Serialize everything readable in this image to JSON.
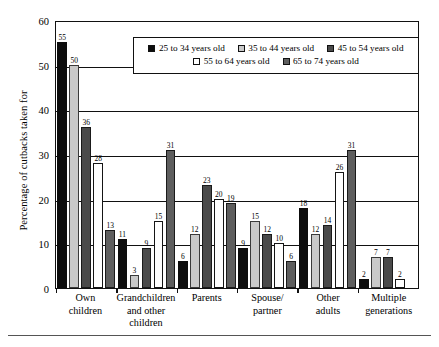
{
  "chart_data": {
    "type": "bar",
    "title": "",
    "xlabel": "",
    "ylabel": "Percentage of cutbacks taken for",
    "ylim": [
      0,
      60
    ],
    "yticks": [
      0,
      10,
      20,
      30,
      40,
      50,
      60
    ],
    "grid": true,
    "legend_position": "top-center-inside",
    "categories": [
      "Own children",
      "Grandchildren and other children",
      "Parents",
      "Spouse/ partner",
      "Other adults",
      "Multiple generations"
    ],
    "series": [
      {
        "name": "25 to 34 years old",
        "color": "#0d0d0d",
        "values": [
          55,
          11,
          6,
          9,
          18,
          2
        ]
      },
      {
        "name": "35 to 44 years old",
        "color": "#c9c9c9",
        "values": [
          50,
          3,
          12,
          15,
          12,
          7
        ]
      },
      {
        "name": "45 to 54 years old",
        "color": "#4a4a4a",
        "values": [
          36,
          9,
          23,
          12,
          14,
          7
        ]
      },
      {
        "name": "55 to 64 years old",
        "color": "#ffffff",
        "values": [
          28,
          15,
          20,
          10,
          26,
          2
        ]
      },
      {
        "name": "65 to 74 years old",
        "color": "#5e5e5e",
        "values": [
          13,
          31,
          19,
          6,
          31,
          0
        ]
      }
    ]
  },
  "axis": {
    "y_title": "Percentage of cutbacks taken for",
    "y_ticks": [
      "60",
      "50",
      "40",
      "30",
      "20",
      "10",
      "0"
    ],
    "x_categories": [
      [
        "Own",
        "children"
      ],
      [
        "Grandchildren",
        "and other",
        "children"
      ],
      [
        "Parents"
      ],
      [
        "Spouse/",
        "partner"
      ],
      [
        "Other",
        "adults"
      ],
      [
        "Multiple",
        "generations"
      ]
    ]
  },
  "legend": {
    "row1": [
      {
        "label": "25 to 34 years old",
        "color": "#0d0d0d"
      },
      {
        "label": "35 to 44 years old",
        "color": "#c9c9c9"
      },
      {
        "label": "45 to 54 years old",
        "color": "#4a4a4a"
      }
    ],
    "row2": [
      {
        "label": "55 to 64 years old",
        "color": "#ffffff"
      },
      {
        "label": "65 to 74 years old",
        "color": "#5e5e5e"
      }
    ]
  }
}
